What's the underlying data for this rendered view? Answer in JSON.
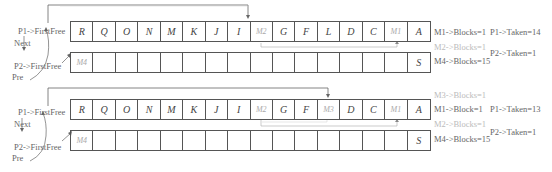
{
  "panels": [
    {
      "top_row": [
        "R",
        "Q",
        "O",
        "N",
        "M",
        "K",
        "J",
        "I",
        "M2",
        "G",
        "F",
        "L",
        "D",
        "C",
        "M1",
        "A"
      ],
      "top_row_faint": [
        8,
        14
      ],
      "bottom_row": [
        "M4",
        "",
        "",
        "",
        "",
        "",
        "",
        "",
        "",
        "",
        "",
        "",
        "",
        "",
        "",
        "S"
      ],
      "bottom_row_faint": [
        0
      ],
      "left_labels": {
        "p1": "P1->FirstFree",
        "next": "Next",
        "p2": "P2->FirstFree",
        "pre": "Pre"
      },
      "right_labels": {
        "m1_blocks": "M1->Blocks=1",
        "m2_blocks": "M2->Blocks=1",
        "m4_blocks": "M4->Blocks=15",
        "p1_taken": "P1->Taken=14",
        "p2_taken": "P2->Taken=1"
      }
    },
    {
      "top_row": [
        "R",
        "Q",
        "O",
        "N",
        "M",
        "K",
        "J",
        "I",
        "M2",
        "G",
        "F",
        "M3",
        "D",
        "C",
        "M1",
        "A"
      ],
      "top_row_faint": [
        8,
        11,
        14
      ],
      "bottom_row": [
        "M4",
        "",
        "",
        "",
        "",
        "",
        "",
        "",
        "",
        "",
        "",
        "",
        "",
        "",
        "",
        "S"
      ],
      "bottom_row_faint": [
        0
      ],
      "left_labels": {
        "p1": "P1->FirstFree",
        "next": "Next",
        "p2": "P2->FirstFree",
        "pre": "Pre"
      },
      "right_labels": {
        "m3_blocks": "M3->Blocks=1",
        "m1_blocks": "M1->Block=1",
        "m2_blocks": "M2->Blocks=1",
        "m4_blocks": "M4->Blocks=15",
        "p1_taken": "P1->Taken=13",
        "p2_taken": "P2->Taken=1"
      }
    }
  ],
  "colors": {
    "line": "#555555",
    "faint": "#aaaaaa",
    "text": "#666666"
  }
}
